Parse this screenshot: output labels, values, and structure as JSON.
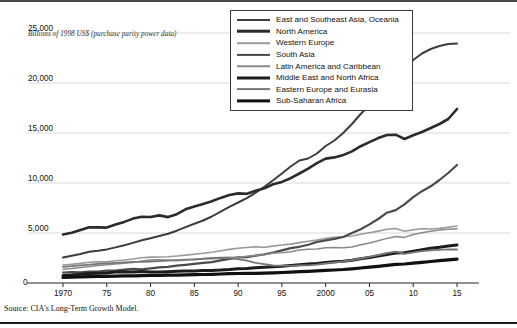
{
  "figure": {
    "axis_title": "Billions of 1998 US$ (purchase parity power data)",
    "source": "Source: CIA's Long-Term Growth Model."
  },
  "legend": {
    "items": [
      {
        "label": "East and Southeast Asia, Oceania",
        "color": "#3d3d3d",
        "width": 2.0
      },
      {
        "label": "North America",
        "color": "#2b2b2b",
        "width": 2.6
      },
      {
        "label": "Western Europe",
        "color": "#9a9a9a",
        "width": 1.6
      },
      {
        "label": "South Asia",
        "color": "#4a4a4a",
        "width": 2.2
      },
      {
        "label": "Latin America and Caribbean",
        "color": "#8a8a8a",
        "width": 1.5
      },
      {
        "label": "Middle East and North Africa",
        "color": "#1c1c1c",
        "width": 3.0
      },
      {
        "label": "Eastern Europe and Eurasia",
        "color": "#777777",
        "width": 1.8
      },
      {
        "label": "Sub-Saharan Africa",
        "color": "#101010",
        "width": 3.2
      }
    ]
  },
  "chart_data": {
    "type": "line",
    "title": "",
    "xlabel": "",
    "ylabel": "Billions of 1998 US$ (purchase parity power data)",
    "xlim": [
      1970,
      2015
    ],
    "ylim": [
      0,
      26500
    ],
    "grid": true,
    "legend_position": "top-right",
    "x_ticks": [
      {
        "value": 1970,
        "label": "1970"
      },
      {
        "value": 1975,
        "label": "75"
      },
      {
        "value": 1980,
        "label": "80"
      },
      {
        "value": 1985,
        "label": "85"
      },
      {
        "value": 1990,
        "label": "90"
      },
      {
        "value": 1995,
        "label": "95"
      },
      {
        "value": 2000,
        "label": "2000"
      },
      {
        "value": 2005,
        "label": "05"
      },
      {
        "value": 2010,
        "label": "10"
      },
      {
        "value": 2015,
        "label": "15"
      }
    ],
    "y_ticks": [
      {
        "value": 0,
        "label": "0"
      },
      {
        "value": 5000,
        "label": "5,000"
      },
      {
        "value": 10000,
        "label": "10,000"
      },
      {
        "value": 15000,
        "label": "15,000"
      },
      {
        "value": 20000,
        "label": "20,000"
      },
      {
        "value": 25000,
        "label": "25,000"
      }
    ],
    "origin_label": "0",
    "x": [
      1970,
      1971,
      1972,
      1973,
      1974,
      1975,
      1976,
      1977,
      1978,
      1979,
      1980,
      1981,
      1982,
      1983,
      1984,
      1985,
      1986,
      1987,
      1988,
      1989,
      1990,
      1991,
      1992,
      1993,
      1994,
      1995,
      1996,
      1997,
      1998,
      1999,
      2000,
      2001,
      2002,
      2003,
      2004,
      2005,
      2006,
      2007,
      2008,
      2009,
      2010,
      2011,
      2012,
      2013,
      2014,
      2015
    ],
    "series": [
      {
        "name": "East and Southeast Asia, Oceania",
        "color": "#3d3d3d",
        "width": 2.0,
        "values": [
          2550,
          2720,
          2900,
          3130,
          3230,
          3360,
          3560,
          3770,
          4010,
          4270,
          4470,
          4700,
          4930,
          5230,
          5590,
          5930,
          6250,
          6650,
          7140,
          7610,
          8050,
          8480,
          9030,
          9620,
          10280,
          10950,
          11650,
          12250,
          12450,
          12950,
          13700,
          14250,
          15000,
          15900,
          16900,
          17800,
          18900,
          20050,
          20900,
          21400,
          22300,
          22950,
          23400,
          23700,
          23900,
          23950
        ]
      },
      {
        "name": "North America",
        "color": "#2b2b2b",
        "width": 2.6,
        "values": [
          4850,
          5020,
          5290,
          5580,
          5560,
          5540,
          5840,
          6110,
          6440,
          6630,
          6600,
          6760,
          6590,
          6880,
          7370,
          7660,
          7910,
          8170,
          8510,
          8800,
          8960,
          8930,
          9230,
          9480,
          9870,
          10110,
          10480,
          10950,
          11440,
          11990,
          12440,
          12560,
          12790,
          13160,
          13680,
          14090,
          14490,
          14800,
          14830,
          14400,
          14780,
          15100,
          15500,
          15900,
          16400,
          17400
        ]
      },
      {
        "name": "Western Europe",
        "color": "#9a9a9a",
        "width": 1.6,
        "values": [
          1800,
          1880,
          1960,
          2080,
          2120,
          2110,
          2220,
          2300,
          2400,
          2520,
          2590,
          2600,
          2630,
          2700,
          2790,
          2880,
          2970,
          3080,
          3220,
          3360,
          3470,
          3550,
          3610,
          3580,
          3690,
          3800,
          3890,
          4040,
          4170,
          4290,
          4470,
          4570,
          4630,
          4700,
          4870,
          5020,
          5190,
          5380,
          5450,
          5180,
          5320,
          5430,
          5400,
          5460,
          5580,
          5700
        ]
      },
      {
        "name": "South Asia",
        "color": "#4a4a4a",
        "width": 2.2,
        "values": [
          1050,
          1080,
          1070,
          1130,
          1140,
          1230,
          1250,
          1340,
          1410,
          1370,
          1470,
          1560,
          1620,
          1740,
          1820,
          1910,
          2010,
          2090,
          2270,
          2420,
          2560,
          2580,
          2730,
          2870,
          3040,
          3260,
          3490,
          3620,
          3830,
          4100,
          4270,
          4420,
          4600,
          4990,
          5380,
          5860,
          6400,
          7030,
          7290,
          7870,
          8590,
          9180,
          9670,
          10300,
          11000,
          11800
        ]
      },
      {
        "name": "Latin America and Caribbean",
        "color": "#8a8a8a",
        "width": 1.5,
        "values": [
          1380,
          1460,
          1550,
          1660,
          1760,
          1820,
          1900,
          1980,
          2060,
          2190,
          2310,
          2320,
          2290,
          2220,
          2300,
          2370,
          2450,
          2530,
          2550,
          2570,
          2560,
          2680,
          2760,
          2860,
          2990,
          3030,
          3130,
          3290,
          3380,
          3390,
          3530,
          3540,
          3530,
          3610,
          3830,
          4010,
          4220,
          4460,
          4640,
          4560,
          4850,
          5030,
          5180,
          5310,
          5380,
          5430
        ]
      },
      {
        "name": "Middle East and North Africa",
        "color": "#1c1c1c",
        "width": 3.0,
        "values": [
          760,
          810,
          880,
          940,
          980,
          1000,
          1090,
          1130,
          1090,
          1140,
          1100,
          1090,
          1130,
          1170,
          1200,
          1200,
          1240,
          1260,
          1290,
          1340,
          1420,
          1450,
          1530,
          1570,
          1620,
          1680,
          1760,
          1830,
          1900,
          1950,
          2060,
          2130,
          2180,
          2280,
          2420,
          2550,
          2690,
          2840,
          2990,
          3020,
          3170,
          3320,
          3470,
          3570,
          3700,
          3800
        ]
      },
      {
        "name": "Eastern Europe and Eurasia",
        "color": "#777777",
        "width": 1.8,
        "values": [
          1620,
          1690,
          1760,
          1840,
          1910,
          1960,
          2010,
          2060,
          2110,
          2120,
          2150,
          2180,
          2230,
          2290,
          2330,
          2350,
          2420,
          2450,
          2500,
          2490,
          2390,
          2240,
          2020,
          1890,
          1750,
          1730,
          1710,
          1760,
          1760,
          1830,
          1950,
          2050,
          2150,
          2290,
          2450,
          2610,
          2800,
          3000,
          3130,
          2910,
          3060,
          3190,
          3260,
          3310,
          3360,
          3350
        ]
      },
      {
        "name": "Sub-Saharan Africa",
        "color": "#101010",
        "width": 3.2,
        "values": [
          560,
          590,
          610,
          640,
          660,
          670,
          690,
          710,
          720,
          740,
          760,
          770,
          780,
          790,
          810,
          840,
          850,
          870,
          900,
          930,
          950,
          960,
          960,
          980,
          1010,
          1050,
          1090,
          1130,
          1170,
          1210,
          1260,
          1300,
          1350,
          1420,
          1500,
          1580,
          1670,
          1770,
          1860,
          1900,
          1990,
          2070,
          2150,
          2230,
          2310,
          2380
        ]
      }
    ]
  }
}
